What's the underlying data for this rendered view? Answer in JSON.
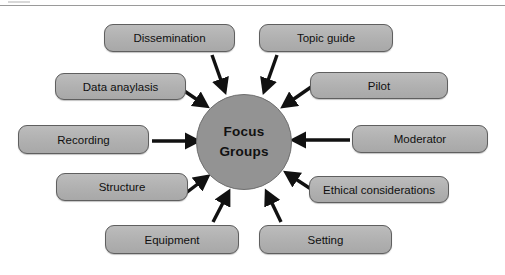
{
  "diagram": {
    "title_text": "Focus Groups",
    "hub": {
      "line1": "Focus",
      "line2": "Groups",
      "fill_color": "#939393",
      "border_color": "#6f6f6f",
      "cx": 244,
      "cy": 142,
      "r": 48
    },
    "style": {
      "node_fill": "#b2b2b2",
      "node_border": "#5f5f5f",
      "arrow_color": "#111111",
      "page_background": "#ffffff",
      "rule_color": "#9a9a9a"
    },
    "nodes": [
      {
        "id": "dissemination",
        "label": "Dissemination",
        "x": 104,
        "y": 24,
        "w": 131,
        "h": 28
      },
      {
        "id": "topic-guide",
        "label": "Topic guide",
        "x": 259,
        "y": 24,
        "w": 134,
        "h": 28
      },
      {
        "id": "data-anaylasis",
        "label": "Data anaylasis",
        "x": 55,
        "y": 73,
        "w": 131,
        "h": 27
      },
      {
        "id": "pilot",
        "label": "Pilot",
        "x": 310,
        "y": 72,
        "w": 138,
        "h": 27
      },
      {
        "id": "recording",
        "label": "Recording",
        "x": 18,
        "y": 125,
        "w": 131,
        "h": 29
      },
      {
        "id": "moderator",
        "label": "Moderator",
        "x": 352,
        "y": 125,
        "w": 136,
        "h": 28
      },
      {
        "id": "structure",
        "label": "Structure",
        "x": 56,
        "y": 173,
        "w": 132,
        "h": 28
      },
      {
        "id": "ethical-considerations",
        "label": "Ethical considerations",
        "x": 309,
        "y": 176,
        "w": 140,
        "h": 27
      },
      {
        "id": "equipment",
        "label": "Equipment",
        "x": 105,
        "y": 225,
        "w": 134,
        "h": 29
      },
      {
        "id": "setting",
        "label": "Setting",
        "x": 259,
        "y": 225,
        "w": 133,
        "h": 29
      }
    ],
    "arrows": [
      {
        "from": "dissemination",
        "x1": 212,
        "y1": 55,
        "x2": 223,
        "y2": 86
      },
      {
        "from": "topic-guide",
        "x1": 277,
        "y1": 55,
        "x2": 266,
        "y2": 86
      },
      {
        "from": "data-anaylasis",
        "x1": 180,
        "y1": 88,
        "x2": 202,
        "y2": 103
      },
      {
        "from": "pilot",
        "x1": 314,
        "y1": 85,
        "x2": 288,
        "y2": 103
      },
      {
        "from": "recording",
        "x1": 152,
        "y1": 141,
        "x2": 192,
        "y2": 141
      },
      {
        "from": "moderator",
        "x1": 350,
        "y1": 140,
        "x2": 299,
        "y2": 140
      },
      {
        "from": "structure",
        "x1": 182,
        "y1": 196,
        "x2": 203,
        "y2": 180
      },
      {
        "from": "ethical-considerations",
        "x1": 314,
        "y1": 191,
        "x2": 291,
        "y2": 176
      },
      {
        "from": "equipment",
        "x1": 213,
        "y1": 222,
        "x2": 226,
        "y2": 197
      },
      {
        "from": "setting",
        "x1": 281,
        "y1": 222,
        "x2": 269,
        "y2": 197
      }
    ]
  }
}
